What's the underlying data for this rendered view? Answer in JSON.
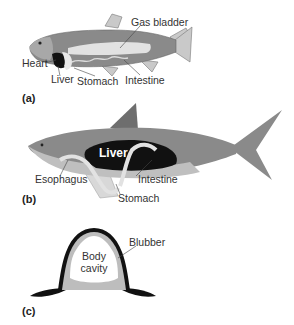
{
  "figure": {
    "panels": [
      {
        "id": "a",
        "label": "(a)",
        "subject": "bony fish",
        "labels": {
          "gas_bladder": "Gas bladder",
          "heart": "Heart",
          "liver": "Liver",
          "stomach": "Stomach",
          "intestine": "Intestine"
        }
      },
      {
        "id": "b",
        "label": "(b)",
        "subject": "shark",
        "labels": {
          "liver": "Liver",
          "esophagus": "Esophagus",
          "intestine": "Intestine",
          "stomach": "Stomach"
        }
      },
      {
        "id": "c",
        "label": "(c)",
        "subject": "cross-section with blubber",
        "labels": {
          "body_cavity_line1": "Body",
          "body_cavity_line2": "cavity",
          "blubber": "Blubber"
        }
      }
    ],
    "colors": {
      "body": "#8a8a8a",
      "body_light": "#bdbdbd",
      "organ_light": "#e2e2e2",
      "liver_dark": "#111111",
      "line": "#444444"
    }
  }
}
